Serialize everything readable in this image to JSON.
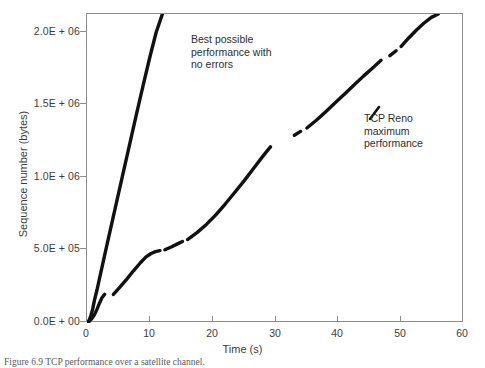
{
  "chart_data": {
    "type": "line",
    "title": "",
    "xlabel": "Time (s)",
    "ylabel": "Sequence number (bytes)",
    "xlim": [
      0,
      60
    ],
    "ylim": [
      0,
      2000000
    ],
    "xticks": [
      0,
      10,
      20,
      30,
      40,
      50,
      60
    ],
    "xtick_labels": [
      "0",
      "10",
      "20",
      "30",
      "40",
      "50",
      "60"
    ],
    "yticks": [
      0,
      500000,
      1000000,
      1500000,
      2000000
    ],
    "ytick_labels": [
      "0.0E + 00",
      "5.0E + 05",
      "1.0E + 06",
      "1.5E + 06",
      "2.0E + 06"
    ],
    "grid": false,
    "legend_position": "none",
    "line_color": "#111111",
    "frame_color": "#8c8c8c",
    "annotations": [
      {
        "name": "best-possible-performance",
        "text": "Best possible\nperformance with\nno errors",
        "points_to_series": "ideal"
      },
      {
        "name": "tcp-reno-maximum-performance",
        "text": "TCP Reno\nmaximum\nperformance",
        "points_to_series": "tcp-reno"
      }
    ],
    "series": [
      {
        "name": "Best possible performance with no errors",
        "id": "ideal",
        "style": "thick-solid",
        "x": [
          0,
          0.3,
          0.6,
          0.9,
          1.2,
          1.6,
          2.0,
          2.6,
          3.2,
          4.0,
          5.0,
          6.0,
          7.0,
          8.0,
          9.0,
          10.0,
          11.0,
          12.0
        ],
        "y": [
          0,
          15000,
          45000,
          90000,
          150000,
          215000,
          290000,
          400000,
          510000,
          655000,
          835000,
          1015000,
          1195000,
          1375000,
          1550000,
          1720000,
          1880000,
          2000000
        ]
      },
      {
        "name": "TCP Reno maximum performance",
        "id": "tcp-reno",
        "style": "thick-solid-with-gaps",
        "segments": [
          {
            "x": [
              0,
              0.4,
              0.8,
              1.2,
              1.6,
              2.0,
              2.4,
              2.8
            ],
            "y": [
              0,
              12000,
              30000,
              55000,
              90000,
              130000,
              165000,
              185000
            ]
          },
          {
            "x": [
              4.2,
              5.2,
              6.3,
              7.4,
              8.5,
              9.4,
              10.2,
              10.9,
              11.6
            ],
            "y": [
              185000,
              230000,
              282000,
              338000,
              390000,
              428000,
              450000,
              462000,
              468000
            ]
          },
          {
            "x": [
              12.4,
              13.4,
              14.4,
              15.2
            ],
            "y": [
              474000,
              492000,
              512000,
              528000
            ]
          },
          {
            "x": [
              16.0,
              17.5,
              19.0,
              20.5,
              22.0,
              23.5,
              25.0,
              26.5,
              28.0,
              29.2
            ],
            "y": [
              540000,
              585000,
              638000,
              700000,
              770000,
              845000,
              920000,
              1000000,
              1080000,
              1140000
            ]
          },
          {
            "x": [
              33.0,
              34.0
            ],
            "y": [
              1215000,
              1240000
            ]
          },
          {
            "x": [
              35.0,
              36.5,
              38.0,
              39.5,
              41.0,
              42.5,
              44.0,
              45.5,
              46.8
            ],
            "y": [
              1262000,
              1312000,
              1368000,
              1425000,
              1482000,
              1540000,
              1598000,
              1652000,
              1700000
            ]
          },
          {
            "x": [
              48.2,
              49.2
            ],
            "y": [
              1730000,
              1762000
            ]
          },
          {
            "x": [
              50.0,
              51.2,
              52.4,
              53.6,
              54.8,
              55.9
            ],
            "y": [
              1790000,
              1845000,
              1895000,
              1940000,
              1978000,
              2000000
            ]
          }
        ]
      }
    ]
  },
  "caption": {
    "text": "Figure 6.9   TCP performance over a satellite channel."
  }
}
